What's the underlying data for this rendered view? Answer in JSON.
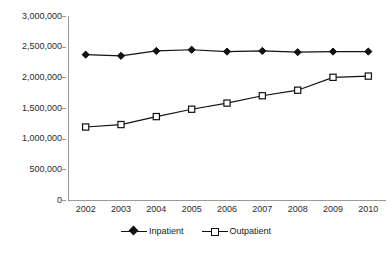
{
  "chart_data": {
    "type": "line",
    "title": "",
    "xlabel": "",
    "ylabel": "",
    "categories": [
      "2002",
      "2003",
      "2004",
      "2005",
      "2006",
      "2007",
      "2008",
      "2009",
      "2010"
    ],
    "series": [
      {
        "name": "Inpatient",
        "marker": "filled-diamond",
        "color": "#111111",
        "values": [
          2370000,
          2350000,
          2430000,
          2450000,
          2420000,
          2430000,
          2410000,
          2420000,
          2420000
        ]
      },
      {
        "name": "Outpatient",
        "marker": "open-square",
        "color": "#111111",
        "values": [
          1190000,
          1230000,
          1360000,
          1480000,
          1580000,
          1700000,
          1790000,
          2000000,
          2020000
        ]
      }
    ],
    "ylim": [
      0,
      3000000
    ],
    "ytick_values": [
      0,
      500000,
      1000000,
      1500000,
      2000000,
      2500000,
      3000000
    ],
    "ytick_labels": [
      "0",
      "500,000",
      "1,000,000",
      "1,500,000",
      "2,000,000",
      "2,500,000",
      "3,000,000"
    ],
    "grid": false,
    "legend_position": "bottom"
  },
  "legend": {
    "items": [
      {
        "label": "Inpatient",
        "marker": "filled-diamond"
      },
      {
        "label": "Outpatient",
        "marker": "open-square"
      }
    ]
  }
}
